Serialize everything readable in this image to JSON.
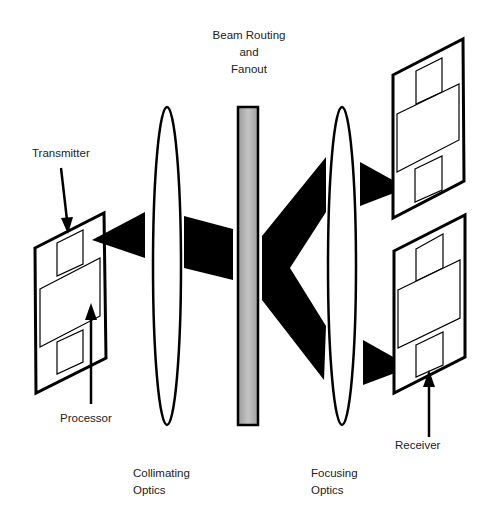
{
  "diagram": {
    "title_label": {
      "line1": "Beam Routing",
      "line2": "and",
      "line3": "Fanout"
    },
    "labels": {
      "transmitter": "Transmitter",
      "processor": "Processor",
      "receiver": "Receiver",
      "collimating": {
        "line1": "Collimating",
        "line2": "Optics"
      },
      "focusing": {
        "line1": "Focusing",
        "line2": "Optics"
      }
    },
    "components": [
      {
        "id": "source-board",
        "role": "transmitter board with processor"
      },
      {
        "id": "collimating-lens",
        "role": "lens"
      },
      {
        "id": "beam-routing-element",
        "role": "grating/fanout plate"
      },
      {
        "id": "focusing-lens",
        "role": "lens"
      },
      {
        "id": "receiver-board-top",
        "role": "receiver board"
      },
      {
        "id": "receiver-board-bottom",
        "role": "receiver board"
      }
    ],
    "colors": {
      "ink": "#000000",
      "grating_fill": "#a8a8a8",
      "paper": "#ffffff"
    }
  }
}
